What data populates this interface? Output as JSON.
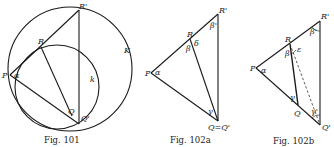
{
  "figures": [
    {
      "id": "fig101",
      "caption": "Fig. 101",
      "labels": {
        "P": "P",
        "R": "R",
        "Rp": "R'",
        "Q": "Q",
        "Qp": "Q'",
        "K": "K",
        "k": "k",
        "alpha": "α"
      }
    },
    {
      "id": "fig102a",
      "caption": "Fig. 102a",
      "labels": {
        "P": "P",
        "R": "R",
        "Rp": "R'",
        "QQp": "Q=Q'",
        "alpha": "α",
        "beta": "β",
        "betap": "β'",
        "delta": "δ",
        "gamma": "γ"
      }
    },
    {
      "id": "fig102b",
      "caption": "Fig. 102b",
      "labels": {
        "P": "P",
        "R": "R",
        "Rp": "R'",
        "Q": "Q",
        "Qp": "Q'",
        "alpha": "α",
        "beta": "β",
        "betap": "β'",
        "epsilon": "ε",
        "gamma": "γ",
        "gammap": "γ'"
      }
    }
  ]
}
